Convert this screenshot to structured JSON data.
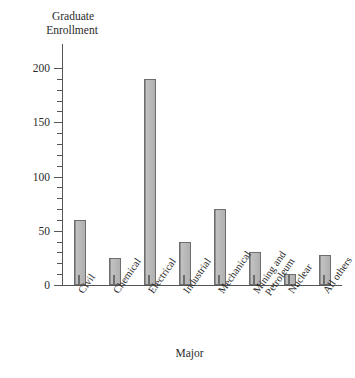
{
  "chart_data": {
    "type": "bar",
    "title": "",
    "ylabel": "Graduate Enrollment",
    "ylabel_lines": [
      "Graduate",
      "Enrollment"
    ],
    "xlabel": "Major",
    "categories": [
      "Civil",
      "Chemical",
      "Electrical",
      "Industrial",
      "Mechanical",
      "Mining and Petroleum",
      "Nuclear",
      "All others"
    ],
    "category_lines": [
      [
        "Civil"
      ],
      [
        "Chemical"
      ],
      [
        "Electrical"
      ],
      [
        "Industrial"
      ],
      [
        "Mechanical"
      ],
      [
        "Mining and",
        "Petroleum"
      ],
      [
        "Nuclear"
      ],
      [
        "All others"
      ]
    ],
    "values": [
      60,
      25,
      190,
      40,
      70,
      30,
      10,
      28
    ],
    "ylim": [
      0,
      210
    ],
    "ytick_labels": [
      "0",
      "50",
      "100",
      "150",
      "200"
    ],
    "ytick_values": [
      0,
      50,
      100,
      150,
      200
    ],
    "yminor_step": 10,
    "grid": false,
    "legend": null,
    "bar_color": "#b4b4b4",
    "bar_edge_color": "#6e6e6e",
    "axis_color": "#555555"
  }
}
